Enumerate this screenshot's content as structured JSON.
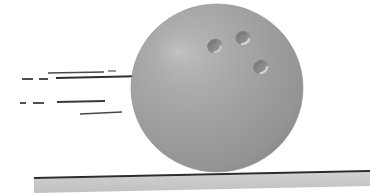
{
  "illustration": {
    "title": "Rolling bowling ball with motion lines",
    "subject": "bowling-ball",
    "canvas": {
      "width": 370,
      "height": 195,
      "background": "#ffffff"
    }
  },
  "ball": {
    "label": "bowling ball",
    "center_x": 217,
    "center_y": 88,
    "radius_x": 86,
    "radius_y": 84,
    "fill": "#9b9b9b",
    "fill_light": "#b4b4b4",
    "fill_dark": "#8a8a8a",
    "edge": "#8f8f8f",
    "highlight": {
      "label": "specular highlight",
      "cx": 178,
      "cy": 52,
      "rx": 26,
      "ry": 22,
      "color": "#c2c2c2"
    },
    "holes": [
      {
        "label": "finger hole left",
        "cx": 215,
        "cy": 46,
        "rx": 8,
        "ry": 7,
        "rotation": -28,
        "fill": "#8b8b8b",
        "shadow": "#7b7b7b",
        "rim": "#d2d2d2"
      },
      {
        "label": "finger hole right",
        "cx": 243,
        "cy": 38,
        "rx": 7.5,
        "ry": 7,
        "rotation": -20,
        "fill": "#8b8b8b",
        "shadow": "#7b7b7b",
        "rim": "#d8d8d8"
      },
      {
        "label": "thumb hole",
        "cx": 261,
        "cy": 67,
        "rx": 8,
        "ry": 7,
        "rotation": -30,
        "fill": "#8b8b8b",
        "shadow": "#7d7d7d",
        "rim": "#d8d8d8"
      }
    ]
  },
  "floor": {
    "label": "bowling lane",
    "fill": "#c9c9c9",
    "edge_color": "#2b2b2b",
    "left_x": 34,
    "right_x": 370,
    "top_left_y": 179,
    "top_right_y": 172,
    "bottom_left_y": 193,
    "bottom_right_y": 186,
    "edge_thickness": 2
  },
  "motion_lines": {
    "label": "speed lines",
    "color": "#3a3a3a",
    "color_soft": "#6d6d6d",
    "upper_group": [
      {
        "label": "line-1",
        "x1": 48,
        "y1": 73,
        "x2": 104,
        "y2": 72,
        "width": 1.6,
        "color": "#4a4a4a"
      },
      {
        "label": "line-2",
        "x1": 108,
        "y1": 71,
        "x2": 116,
        "y2": 71,
        "width": 1.4,
        "color": "#6d6d6d"
      },
      {
        "label": "line-3",
        "x1": 22,
        "y1": 79,
        "x2": 33,
        "y2": 79,
        "width": 1.8,
        "color": "#3a3a3a"
      },
      {
        "label": "line-4",
        "x1": 39,
        "y1": 79,
        "x2": 48,
        "y2": 79,
        "width": 1.8,
        "color": "#3a3a3a"
      },
      {
        "label": "line-5",
        "x1": 56,
        "y1": 78,
        "x2": 146,
        "y2": 76,
        "width": 1.8,
        "color": "#2e2e2e"
      }
    ],
    "lower_group": [
      {
        "label": "line-6",
        "x1": 20,
        "y1": 103,
        "x2": 26,
        "y2": 103,
        "width": 1.8,
        "color": "#3a3a3a"
      },
      {
        "label": "line-7",
        "x1": 33,
        "y1": 103,
        "x2": 44,
        "y2": 103,
        "width": 1.8,
        "color": "#3a3a3a"
      },
      {
        "label": "line-8",
        "x1": 57,
        "y1": 102,
        "x2": 105,
        "y2": 101,
        "width": 1.9,
        "color": "#3a3a3a"
      },
      {
        "label": "line-9",
        "x1": 80,
        "y1": 114,
        "x2": 122,
        "y2": 112,
        "width": 1.7,
        "color": "#4a4a4a"
      }
    ]
  }
}
